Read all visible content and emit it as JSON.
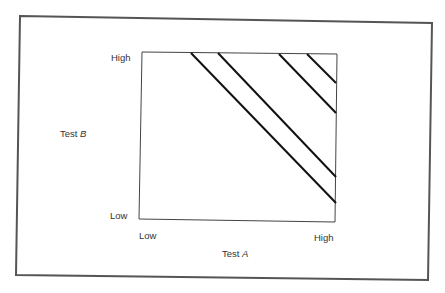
{
  "diagram": {
    "type": "iso-score regions on two-test plot",
    "y_axis": {
      "title": "Test",
      "title_var": "B",
      "low_label": "Low",
      "high_label": "High"
    },
    "x_axis": {
      "title": "Test",
      "title_var": "A",
      "low_label": "Low",
      "high_label": "High"
    },
    "lines": [
      {
        "id": "line-1",
        "x1": 191,
        "y1": 53,
        "x2": 336,
        "y2": 203
      },
      {
        "id": "line-2",
        "x1": 218,
        "y1": 53,
        "x2": 336,
        "y2": 177
      },
      {
        "id": "line-3",
        "x1": 279,
        "y1": 54,
        "x2": 336,
        "y2": 113
      },
      {
        "id": "line-4",
        "x1": 307,
        "y1": 54,
        "x2": 336,
        "y2": 83
      }
    ],
    "colors": {
      "frame": "#555555",
      "axes": "#444444",
      "lines": "#111111",
      "text": "#333333"
    }
  }
}
